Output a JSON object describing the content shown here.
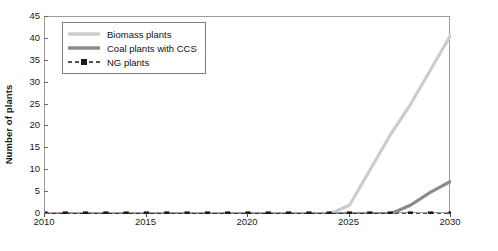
{
  "chart_data": {
    "type": "line",
    "title": "",
    "xlabel": "",
    "ylabel": "Number of plants",
    "xlim": [
      2010,
      2030
    ],
    "ylim": [
      0,
      45
    ],
    "ytick_values": [
      0,
      5,
      10,
      15,
      20,
      25,
      30,
      35,
      40,
      45
    ],
    "xtick_values": [
      2010,
      2015,
      2020,
      2025,
      2030
    ],
    "xtick_labels": [
      "2010",
      "2015",
      "2020",
      "2025",
      "2030"
    ],
    "grid": false,
    "legend_position": "upper-left",
    "x": [
      2010,
      2011,
      2012,
      2013,
      2014,
      2015,
      2016,
      2017,
      2018,
      2019,
      2020,
      2021,
      2022,
      2023,
      2024,
      2025,
      2026,
      2027,
      2028,
      2029,
      2030
    ],
    "series": [
      {
        "name": "Biomass plants",
        "color": "#cccccc",
        "style": "solid",
        "marker": "none",
        "values": [
          0,
          0,
          0,
          0,
          0,
          0,
          0,
          0,
          0,
          0,
          0,
          0,
          0,
          0,
          0,
          2,
          10,
          18,
          25,
          33,
          41
        ]
      },
      {
        "name": "Coal plants with CCS",
        "color": "#8a8a8a",
        "style": "solid",
        "marker": "none",
        "values": [
          0,
          0,
          0,
          0,
          0,
          0,
          0,
          0,
          0,
          0,
          0,
          0,
          0,
          0,
          0,
          0,
          0,
          0,
          2,
          5,
          7.5
        ]
      },
      {
        "name": "NG plants",
        "color": "#1a1a1a",
        "style": "dashed",
        "marker": "square",
        "values": [
          0,
          0,
          0,
          0,
          0,
          0,
          0,
          0,
          0,
          0,
          0,
          0,
          0,
          0,
          0,
          0,
          0,
          0,
          0,
          0,
          0
        ]
      }
    ]
  },
  "legend": {
    "items": [
      {
        "label": "Biomass plants"
      },
      {
        "label": "Coal plants with CCS"
      },
      {
        "label": "NG plants"
      }
    ]
  },
  "caption": {
    "text": ""
  }
}
